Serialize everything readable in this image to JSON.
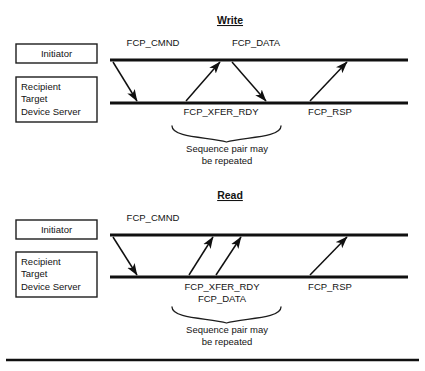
{
  "figure": {
    "kind": "sequence-diagram",
    "background_color": "#ffffff",
    "ink_color": "#101010"
  },
  "sections": [
    {
      "id": "write",
      "title": "Write",
      "title_x": 230,
      "title_y": 24,
      "actors": [
        {
          "id": "initiator",
          "lines": [
            "Initiator"
          ],
          "centered": true,
          "box": {
            "x": 16,
            "y": 44,
            "w": 81,
            "h": 19
          },
          "timeline": {
            "x1": 110,
            "x2": 408,
            "y": 60
          }
        },
        {
          "id": "recipient",
          "lines": [
            "Recipient",
            "Target",
            "Device Server"
          ],
          "centered": false,
          "box": {
            "x": 16,
            "y": 77,
            "w": 81,
            "h": 45
          },
          "timeline": {
            "x1": 110,
            "x2": 408,
            "y": 103
          }
        }
      ],
      "messages": [
        {
          "id": "fcp-cmnd",
          "label": "FCP_CMND",
          "direction": "down",
          "x1": 113,
          "x2": 137,
          "label_x": 153,
          "label_y": 46
        },
        {
          "id": "fcp-xfer-rdy",
          "label": "FCP_XFER_RDY",
          "direction": "up",
          "x1": 186,
          "x2": 220,
          "label_x": 221,
          "label_y": 115
        },
        {
          "id": "fcp-data",
          "label": "FCP_DATA",
          "direction": "down",
          "x1": 232,
          "x2": 266,
          "label_x": 256,
          "label_y": 46
        },
        {
          "id": "fcp-rsp",
          "label": "FCP_RSP",
          "direction": "up",
          "x1": 310,
          "x2": 347,
          "label_x": 330,
          "label_y": 115
        }
      ],
      "brace": {
        "x1": 172,
        "x2": 281,
        "y_top": 126,
        "y_bottom": 138,
        "tip_y": 142
      },
      "note": {
        "lines": [
          "Sequence pair may",
          "be repeated"
        ],
        "x": 227,
        "y1": 152,
        "y2": 164
      }
    },
    {
      "id": "read",
      "title": "Read",
      "title_x": 230,
      "title_y": 199,
      "actors": [
        {
          "id": "initiator",
          "lines": [
            "Initiator"
          ],
          "centered": true,
          "box": {
            "x": 16,
            "y": 220,
            "w": 81,
            "h": 19
          },
          "timeline": {
            "x1": 110,
            "x2": 408,
            "y": 235
          }
        },
        {
          "id": "recipient",
          "lines": [
            "Recipient",
            "Target",
            "Device Server"
          ],
          "centered": false,
          "box": {
            "x": 16,
            "y": 252,
            "w": 81,
            "h": 45
          },
          "timeline": {
            "x1": 110,
            "x2": 408,
            "y": 277
          }
        }
      ],
      "messages": [
        {
          "id": "fcp-cmnd",
          "label": "FCP_CMND",
          "direction": "down",
          "x1": 113,
          "x2": 137,
          "label_x": 153,
          "label_y": 221
        },
        {
          "id": "fcp-xfer-rdy",
          "label": "FCP_XFER_RDY",
          "direction": "up",
          "x1": 189,
          "x2": 213,
          "label_x": 222,
          "label_y": 290
        },
        {
          "id": "fcp-data",
          "label": "FCP_DATA",
          "direction": "up",
          "x1": 216,
          "x2": 241,
          "label_x": 222,
          "label_y": 302
        },
        {
          "id": "fcp-rsp",
          "label": "FCP_RSP",
          "direction": "up",
          "x1": 310,
          "x2": 347,
          "label_x": 330,
          "label_y": 290
        }
      ],
      "brace": {
        "x1": 172,
        "x2": 281,
        "y_top": 307,
        "y_bottom": 319,
        "tip_y": 323
      },
      "note": {
        "lines": [
          "Sequence pair may",
          "be repeated"
        ],
        "x": 227,
        "y1": 333,
        "y2": 345
      }
    }
  ],
  "footer_rule": {
    "x1": 6,
    "x2": 419,
    "y": 360
  }
}
